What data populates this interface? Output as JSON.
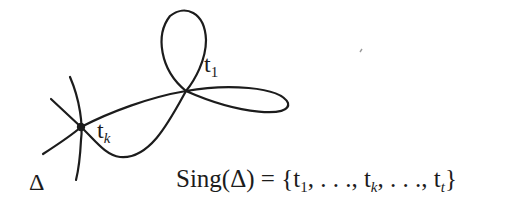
{
  "diagram": {
    "type": "plane curve with singular points and lines through a node",
    "curve_name": "Δ",
    "labels": {
      "delta": "Δ",
      "t1": {
        "base": "t",
        "sub": "1"
      },
      "tk": {
        "base": "t",
        "sub": "k"
      }
    },
    "singular_points": [
      {
        "name": "t_1",
        "description": "node where upper loop and right lobe cross"
      },
      {
        "name": "t_k",
        "description": "marked node (dot) with several lines passing through"
      }
    ],
    "formula": {
      "lhs": "Sing(Δ)",
      "equals": "=",
      "open_brace": "{",
      "items": [
        {
          "base": "t",
          "sub": "1"
        },
        {
          "text": ". . ."
        },
        {
          "base": "t",
          "sub": "k"
        },
        {
          "text": ". . ."
        },
        {
          "base": "t",
          "sub": "t"
        }
      ],
      "separator": ", ",
      "close_brace": "}"
    },
    "stroke_color": "#1c1c1c",
    "background": "#ffffff"
  }
}
